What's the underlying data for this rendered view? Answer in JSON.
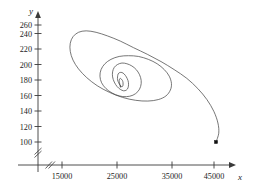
{
  "figure": {
    "background_color": "#ffffff",
    "ink_color": "#3a3a3a",
    "curve_color": "#4a4a4a",
    "marker_color": "#101010"
  },
  "axes": {
    "x_axis_name": "x",
    "y_axis_name": "y",
    "x_has_break": true,
    "y_has_break": true,
    "x_arrow": true,
    "y_arrow": true
  },
  "chart_data": {
    "type": "line",
    "title": "",
    "subtitle": "",
    "xlabel": "x",
    "ylabel": "y",
    "grid": false,
    "legend": "none",
    "axis_break": {
      "x": true,
      "y": true
    },
    "xlim": [
      10000,
      48000
    ],
    "ylim": [
      90,
      272
    ],
    "xticks": [
      15000,
      25000,
      35000,
      45000
    ],
    "xticklabels": [
      "15000",
      "25000",
      "35000",
      "45000"
    ],
    "yticks": [
      100,
      120,
      140,
      160,
      180,
      200,
      220,
      240,
      260
    ],
    "yticklabels": [
      "100",
      "120",
      "140",
      "160",
      "180",
      "200",
      "220",
      "240",
      "260"
    ],
    "annotations": [
      {
        "label": "start-point-marker",
        "x": 43000,
        "y": 100,
        "marker": "filled-square-dot"
      }
    ],
    "series": [
      {
        "name": "trajectory",
        "description": "inward spiral orbit converging to a focus",
        "focus": [
          25600,
          175
        ],
        "x": [
          43000,
          43500,
          43350,
          42600,
          41350,
          39700,
          37700,
          35400,
          33000,
          30500,
          28000,
          25600,
          23300,
          21200,
          19400,
          18000,
          17000,
          16500,
          16500,
          17000,
          18000,
          19500,
          21400,
          23600,
          26000,
          28400,
          30600,
          32500,
          33900,
          34700,
          34900,
          34500,
          33600,
          32300,
          30700,
          28900,
          27100,
          25400,
          23900,
          22800,
          22100,
          21900,
          22200,
          23000,
          24100,
          25400,
          26700,
          27900,
          28800,
          29300,
          29400,
          29100,
          28500,
          27700,
          26800,
          25900,
          25100,
          24500,
          24200,
          24200,
          24500,
          25000,
          25600,
          26200,
          26700,
          27000,
          27100,
          27000,
          26700,
          26300,
          25900,
          25500,
          25200,
          25100,
          25100,
          25300,
          25500,
          25800,
          26000,
          26100,
          26100,
          26000,
          25800,
          25600,
          25450,
          25400,
          25450,
          25550,
          25650,
          25700,
          25700,
          25650,
          25600,
          25580,
          25590,
          25600
        ],
        "y": [
          100,
          112,
          126,
          142,
          158,
          173,
          187,
          199,
          210,
          220,
          229,
          238,
          245,
          250,
          252,
          250,
          244,
          235,
          224,
          212,
          200,
          188,
          177,
          168,
          161,
          157,
          156,
          158,
          163,
          171,
          180,
          190,
          199,
          207,
          213,
          217,
          218,
          217,
          213,
          207,
          199,
          190,
          181,
          173,
          167,
          163,
          162,
          164,
          169,
          176,
          184,
          192,
          199,
          204,
          207,
          208,
          206,
          202,
          196,
          189,
          182,
          176,
          172,
          170,
          171,
          174,
          179,
          184,
          189,
          193,
          195,
          195,
          193,
          189,
          185,
          181,
          178,
          176,
          176,
          178,
          181,
          184,
          186,
          187,
          186,
          184,
          181,
          178,
          176,
          175,
          175,
          176,
          177,
          176,
          175,
          175
        ]
      }
    ]
  }
}
